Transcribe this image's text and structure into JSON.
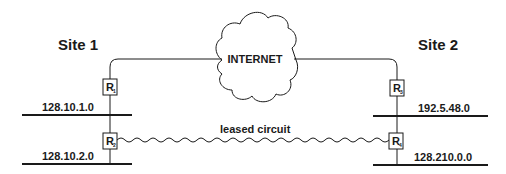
{
  "diagram": {
    "cloud": {
      "label": "INTERNET"
    },
    "sites": [
      {
        "label": "Site 1",
        "networks": [
          "128.10.1.0",
          "128.10.2.0"
        ],
        "routers": [
          {
            "letter": "R",
            "sub": "1"
          },
          {
            "letter": "R",
            "sub": "2"
          }
        ]
      },
      {
        "label": "Site 2",
        "networks": [
          "192.5.48.0",
          "128.210.0.0"
        ],
        "routers": [
          {
            "letter": "R",
            "sub": "3"
          },
          {
            "letter": "R",
            "sub": "4"
          }
        ]
      }
    ],
    "link": {
      "label": "leased circuit"
    }
  }
}
